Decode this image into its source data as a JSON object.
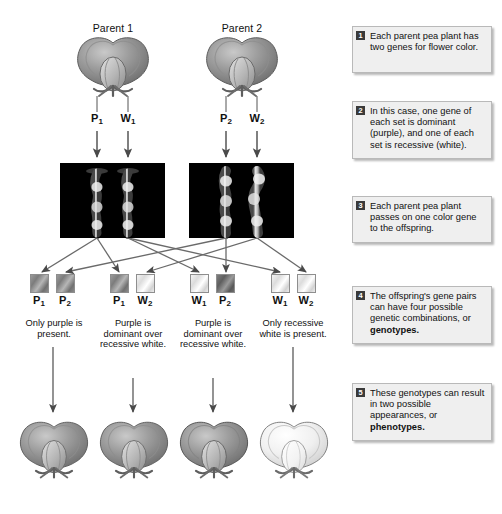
{
  "diagram": {
    "parents": [
      {
        "label": "Parent 1",
        "genes": [
          {
            "symbol": "P",
            "sub": "1",
            "type": "purple"
          },
          {
            "symbol": "W",
            "sub": "1",
            "type": "white"
          }
        ]
      },
      {
        "label": "Parent 2",
        "genes": [
          {
            "symbol": "P",
            "sub": "2",
            "type": "purple"
          },
          {
            "symbol": "W",
            "sub": "2",
            "type": "white"
          }
        ]
      }
    ],
    "offspring": [
      {
        "genes": [
          {
            "symbol": "P",
            "sub": "1",
            "type": "purple"
          },
          {
            "symbol": "P",
            "sub": "2",
            "type": "purple"
          }
        ],
        "caption": "Only purple is present.",
        "flower": "purple"
      },
      {
        "genes": [
          {
            "symbol": "P",
            "sub": "1",
            "type": "purple"
          },
          {
            "symbol": "W",
            "sub": "2",
            "type": "white"
          }
        ],
        "caption": "Purple is dominant over recessive white.",
        "flower": "purple"
      },
      {
        "genes": [
          {
            "symbol": "W",
            "sub": "1",
            "type": "white"
          },
          {
            "symbol": "P",
            "sub": "2",
            "type": "purple"
          }
        ],
        "caption": "Purple is dominant over recessive white.",
        "flower": "purple"
      },
      {
        "genes": [
          {
            "symbol": "W",
            "sub": "1",
            "type": "white"
          },
          {
            "symbol": "W",
            "sub": "2",
            "type": "white"
          }
        ],
        "caption": "Only recessive white is present.",
        "flower": "white"
      }
    ],
    "callouts": [
      {
        "number": "1",
        "text": "Each parent pea plant has two genes for flower color.",
        "bold": ""
      },
      {
        "number": "2",
        "text": "In this case, one gene of each set is dominant (purple), and one of each set is recessive (white).",
        "bold": ""
      },
      {
        "number": "3",
        "text": "Each parent pea plant passes on one color gene to the offspring.",
        "bold": ""
      },
      {
        "number": "4",
        "text": "The offspring's gene pairs can have four possible genetic combinations, or ",
        "bold": "genotypes."
      },
      {
        "number": "5",
        "text": "These genotypes can result in two possible appearances, or ",
        "bold": "phenotypes."
      }
    ],
    "colors": {
      "callout_bg": "#efefef",
      "callout_border": "#b9b9b9",
      "badge_bg": "#3a3a3a",
      "arrow": "#4a4a4a",
      "karyotype_bg": "#000000"
    },
    "icons": {
      "arrow": "arrow-down-icon",
      "flower": "pea-flower-icon",
      "chromosome": "chromosome-icon"
    }
  }
}
